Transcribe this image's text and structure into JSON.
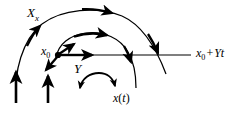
{
  "figure": {
    "type": "vector-field-flow-diagram",
    "background_color": "#ffffff",
    "stroke_color": "#000000",
    "labels": {
      "outer_flow": {
        "base": "X",
        "subscript": "x",
        "text": "X_x"
      },
      "initial_point": {
        "base": "x",
        "subscript": "0",
        "text": "x0"
      },
      "vector_Y": {
        "base": "Y",
        "text": "Y"
      },
      "horizontal_line": {
        "base": "x",
        "subscript": "0",
        "operator": "+",
        "tail": "Yt",
        "text": "x0 + Yt"
      },
      "trajectory": {
        "base": "x",
        "argument": "t",
        "text": "x(t)"
      }
    },
    "elements": {
      "outer_arc": "large outer flow arc with rightward arrowhead at apex and downward arrowhead on descending right branch",
      "middle_arc": "middle flow arc with rightward arrowhead at apex and downward arrowhead on right branch crossing the horizontal line",
      "inner_arc": "small inner arc with arrowheads at both ends near the bottom",
      "horizontal_line": "straight horizontal line through x0 extending right to the x0 + Yt label",
      "point_marker": "filled dot marking x0",
      "vector_Y_arrow": "horizontal rightward arrow from x0 labelled Y",
      "up_right_arrow": "short arrow from x0 pointing up and to the right",
      "down_left_arrow": "short arrow from x0 pointing down and to the left",
      "vertical_arrows": "two vertical upward arrows at the lower left"
    }
  }
}
